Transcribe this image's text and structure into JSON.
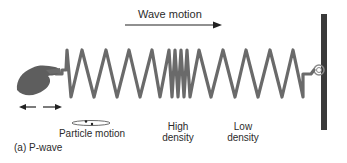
{
  "figure": {
    "caption": "(a) P-wave",
    "wave_motion_label": "Wave motion",
    "particle_motion_label": "Particle motion",
    "high_density_label_line1": "High",
    "high_density_label_line2": "density",
    "low_density_label_line1": "Low",
    "low_density_label_line2": "density"
  },
  "colors": {
    "spring": "#6a6a6a",
    "wall": "#3a3a3a",
    "hand": "#5e5e5e",
    "arrow": "#222222",
    "text": "#2b2b2b"
  },
  "icons": {
    "hand": "hand-icon",
    "push_pull_arrows": "double-arrow-icon",
    "wave_arrow": "arrow-right-icon",
    "particle_orbit": "ellipse-orbit-icon",
    "wall": "fixed-wall",
    "attachment": "ring-eye-icon"
  }
}
